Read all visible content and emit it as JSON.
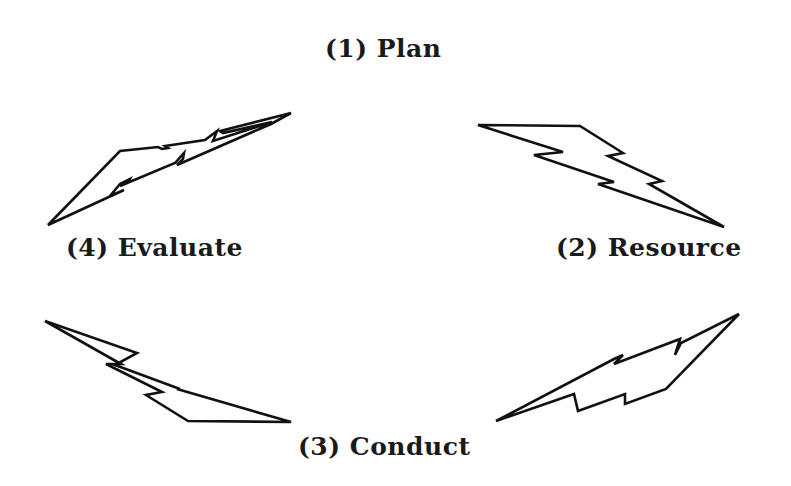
{
  "diagram": {
    "stages": [
      {
        "id": 1,
        "label": "(1) Plan"
      },
      {
        "id": 2,
        "label": "(2) Resource"
      },
      {
        "id": 3,
        "label": "(3) Conduct"
      },
      {
        "id": 4,
        "label": "(4) Evaluate"
      }
    ],
    "connectors": [
      {
        "from": "(4) Evaluate",
        "to": "(1) Plan",
        "shape": "lightning-bolt"
      },
      {
        "from": "(1) Plan",
        "to": "(2) Resource",
        "shape": "lightning-bolt"
      },
      {
        "from": "(2) Resource",
        "to": "(3) Conduct",
        "shape": "lightning-bolt"
      },
      {
        "from": "(3) Conduct",
        "to": "(4) Evaluate",
        "shape": "lightning-bolt"
      }
    ],
    "colors": {
      "stroke": "#111111",
      "text": "#1a1a1a",
      "background": "#ffffff"
    }
  }
}
